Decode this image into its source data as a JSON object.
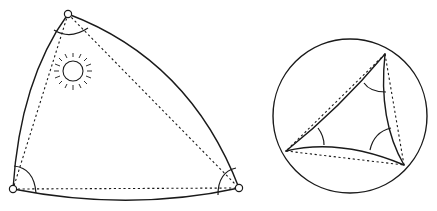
{
  "figure": {
    "description": "Geodesic triangles: a spherical triangle (angle sum > 180°) compared with a hyperbolic triangle in a disk (angle sum < 180°)",
    "colors": {
      "ink": "#1a1a1a",
      "background": "#ffffff"
    }
  },
  "left_figure": {
    "name": "spherical-triangle",
    "vertices": {
      "top": [
        68,
        14
      ],
      "bottom_left": [
        13,
        189
      ],
      "bottom_right": [
        239,
        188
      ]
    },
    "edges": "convex-outward solid arcs",
    "straight_chords": "dotted",
    "angle_marks": 3,
    "decoration": "sun-icon"
  },
  "right_figure": {
    "name": "hyperbolic-triangle-in-disk",
    "disk": {
      "cx": 350,
      "cy": 116,
      "r": 77
    },
    "vertices": {
      "top": [
        385,
        54
      ],
      "left": [
        286,
        151
      ],
      "bottom_right": [
        404,
        165
      ]
    },
    "edges": "concave-inward solid arcs",
    "straight_chords": "dotted",
    "angle_marks": 3
  }
}
